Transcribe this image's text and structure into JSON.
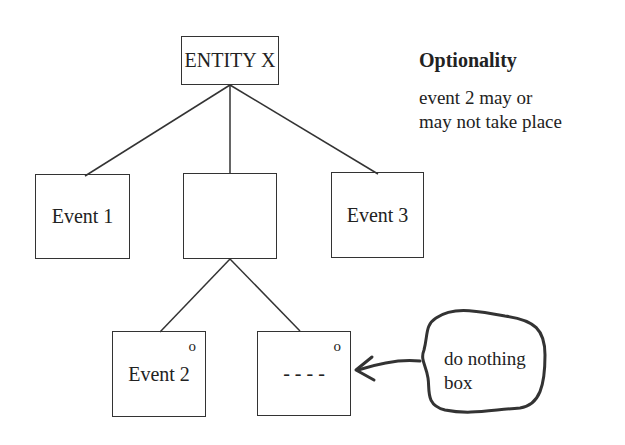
{
  "diagram": {
    "root": {
      "label": "ENTITY X"
    },
    "level1": [
      {
        "label": "Event 1"
      },
      {
        "label": ""
      },
      {
        "label": "Event 3"
      }
    ],
    "level2": [
      {
        "label": "Event 2",
        "marker": "o"
      },
      {
        "label": "- - - -",
        "marker": "o"
      }
    ],
    "annotation": {
      "label_line1": "do nothing",
      "label_line2": "box"
    }
  },
  "legend": {
    "title": "Optionality",
    "line1": "event 2 may or",
    "line2": "may not take place"
  },
  "colors": {
    "stroke": "#333333",
    "background": "#ffffff"
  }
}
